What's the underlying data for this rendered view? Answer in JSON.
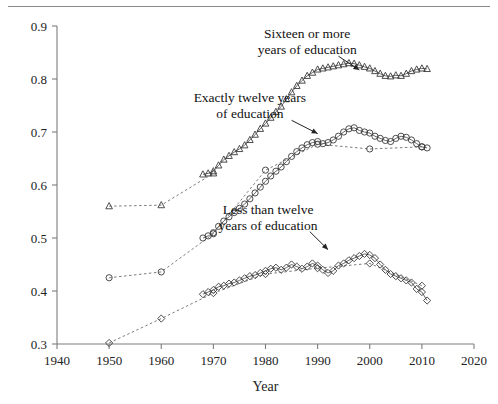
{
  "figure": {
    "has_top_rule": true,
    "background": "#ffffff"
  },
  "chart_data": {
    "type": "scatter",
    "title": "",
    "subtitle": "",
    "xlabel": "Year",
    "ylabel": "",
    "xlim": [
      1940,
      2020
    ],
    "ylim": [
      0.3,
      0.9
    ],
    "xticks": [
      1940,
      1950,
      1960,
      1970,
      1980,
      1990,
      2000,
      2010,
      2020
    ],
    "xtick_labels": [
      "1940",
      "1950",
      "1960",
      "1970",
      "1980",
      "1990",
      "2000",
      "2010",
      "2020"
    ],
    "yticks": [
      0.3,
      0.4,
      0.5,
      0.6,
      0.7,
      0.8,
      0.9
    ],
    "ytick_labels": [
      "0.3",
      "0.4",
      "0.5",
      "0.6",
      "0.7",
      "0.8",
      "0.9"
    ],
    "grid": false,
    "legend_position": "inline-annotations",
    "marker_colors": {
      "outline": "#3a3a3a",
      "line_solid": "#555555",
      "line_dashed": "#6b6b6b",
      "axis": "#7d7d7d"
    },
    "annotations": [
      {
        "id": "sixteen-plus",
        "text_lines": [
          "Sixteen or more",
          "years of education"
        ],
        "text_x": 1988.0,
        "text_y": 0.878,
        "arrow_from": [
          1994.0,
          0.843
        ],
        "arrow_to": [
          1998.0,
          0.817
        ]
      },
      {
        "id": "exactly-twelve",
        "text_lines": [
          "Exactly twelve years",
          "of education"
        ],
        "text_x": 1977.0,
        "text_y": 0.757,
        "arrow_from": [
          1985.0,
          0.722
        ],
        "arrow_to": [
          1990.0,
          0.697
        ]
      },
      {
        "id": "less-than-twelve",
        "text_lines": [
          "Less than twelve",
          "years of education"
        ],
        "text_x": 1980.5,
        "text_y": 0.545,
        "arrow_from": [
          1988.5,
          0.512
        ],
        "arrow_to": [
          1992.0,
          0.478
        ]
      }
    ],
    "series": [
      {
        "name": "Sixteen or more years of education",
        "marker": "triangle",
        "line_style": "dashed",
        "sparse": true,
        "x": [
          1950,
          1960,
          1970
        ],
        "values": [
          0.56,
          0.562,
          0.622
        ]
      },
      {
        "name": "Sixteen or more years of education (annual)",
        "marker": "triangle",
        "line_style": "solid",
        "sparse": false,
        "x": [
          1968,
          1969,
          1970,
          1971,
          1972,
          1973,
          1974,
          1975,
          1976,
          1977,
          1978,
          1979,
          1980,
          1981,
          1982,
          1983,
          1984,
          1985,
          1986,
          1987,
          1988,
          1989,
          1990,
          1991,
          1992,
          1993,
          1994,
          1995,
          1996,
          1997,
          1998,
          1999,
          2000,
          2001,
          2002,
          2003,
          2004,
          2005,
          2006,
          2007,
          2008,
          2009,
          2010,
          2011
        ],
        "values": [
          0.62,
          0.622,
          0.626,
          0.637,
          0.648,
          0.655,
          0.662,
          0.668,
          0.675,
          0.685,
          0.695,
          0.706,
          0.716,
          0.727,
          0.738,
          0.748,
          0.762,
          0.775,
          0.787,
          0.797,
          0.806,
          0.812,
          0.818,
          0.82,
          0.822,
          0.824,
          0.826,
          0.828,
          0.83,
          0.829,
          0.826,
          0.823,
          0.82,
          0.815,
          0.81,
          0.806,
          0.805,
          0.807,
          0.806,
          0.81,
          0.815,
          0.818,
          0.82,
          0.819
        ]
      },
      {
        "name": "Exactly twelve years of education",
        "marker": "circle",
        "line_style": "dashed",
        "sparse": true,
        "x": [
          1950,
          1960,
          1970,
          1980,
          1990,
          2000,
          2010
        ],
        "values": [
          0.425,
          0.436,
          0.508,
          0.628,
          0.677,
          0.668,
          0.672
        ]
      },
      {
        "name": "Exactly twelve years of education (annual)",
        "marker": "circle",
        "line_style": "solid",
        "sparse": false,
        "x": [
          1968,
          1969,
          1970,
          1971,
          1972,
          1973,
          1974,
          1975,
          1976,
          1977,
          1978,
          1979,
          1980,
          1981,
          1982,
          1983,
          1984,
          1985,
          1986,
          1987,
          1988,
          1989,
          1990,
          1991,
          1992,
          1993,
          1994,
          1995,
          1996,
          1997,
          1998,
          1999,
          2000,
          2001,
          2002,
          2003,
          2004,
          2005,
          2006,
          2007,
          2008,
          2009,
          2010,
          2011
        ],
        "values": [
          0.5,
          0.504,
          0.51,
          0.522,
          0.532,
          0.54,
          0.548,
          0.556,
          0.564,
          0.574,
          0.585,
          0.596,
          0.607,
          0.617,
          0.626,
          0.634,
          0.644,
          0.654,
          0.663,
          0.67,
          0.676,
          0.68,
          0.682,
          0.678,
          0.68,
          0.685,
          0.692,
          0.7,
          0.706,
          0.708,
          0.703,
          0.7,
          0.698,
          0.692,
          0.688,
          0.684,
          0.682,
          0.688,
          0.692,
          0.69,
          0.685,
          0.678,
          0.672,
          0.67
        ]
      },
      {
        "name": "Less than twelve years of education",
        "marker": "diamond",
        "line_style": "dashed",
        "sparse": true,
        "x": [
          1950,
          1960,
          1970,
          1980,
          1990,
          2000,
          2010
        ],
        "values": [
          0.302,
          0.348,
          0.396,
          0.432,
          0.443,
          0.452,
          0.41
        ]
      },
      {
        "name": "Less than twelve years of education (annual)",
        "marker": "diamond",
        "line_style": "solid",
        "sparse": false,
        "x": [
          1968,
          1969,
          1970,
          1971,
          1972,
          1973,
          1974,
          1975,
          1976,
          1977,
          1978,
          1979,
          1980,
          1981,
          1982,
          1983,
          1984,
          1985,
          1986,
          1987,
          1988,
          1989,
          1990,
          1991,
          1992,
          1993,
          1994,
          1995,
          1996,
          1997,
          1998,
          1999,
          2000,
          2001,
          2002,
          2003,
          2004,
          2005,
          2006,
          2007,
          2008,
          2009,
          2010,
          2011
        ],
        "values": [
          0.394,
          0.398,
          0.402,
          0.408,
          0.41,
          0.414,
          0.416,
          0.42,
          0.424,
          0.428,
          0.43,
          0.434,
          0.438,
          0.442,
          0.444,
          0.44,
          0.444,
          0.45,
          0.446,
          0.442,
          0.446,
          0.452,
          0.448,
          0.44,
          0.434,
          0.438,
          0.448,
          0.452,
          0.458,
          0.462,
          0.466,
          0.47,
          0.468,
          0.462,
          0.45,
          0.44,
          0.432,
          0.428,
          0.424,
          0.42,
          0.416,
          0.404,
          0.398,
          0.382
        ]
      }
    ]
  }
}
